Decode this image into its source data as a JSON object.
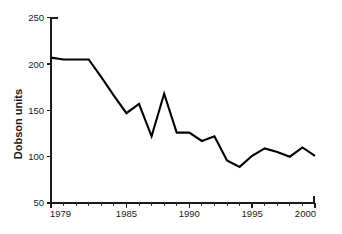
{
  "chart_data": {
    "type": "line",
    "title": "",
    "subtitle": "",
    "xlabel": "",
    "ylabel": "Dobson units",
    "xlim": [
      1979,
      2000
    ],
    "ylim": [
      50,
      250
    ],
    "grid": false,
    "legend": null,
    "x_tick_labels": [
      "1979",
      "1985",
      "1990",
      "1995",
      "2000"
    ],
    "x_tick_values": [
      1979,
      1985,
      1990,
      1995,
      2000
    ],
    "x_minor_tick_values": [
      1980,
      1981,
      1982,
      1983,
      1984,
      1986,
      1987,
      1988,
      1989,
      1991,
      1992,
      1993,
      1994,
      1996,
      1997,
      1998,
      1999
    ],
    "y_tick_labels": [
      "50",
      "100",
      "150",
      "200",
      "250"
    ],
    "y_tick_values": [
      50,
      100,
      150,
      200,
      250
    ],
    "line_color": "#000000",
    "background_color": "#ffffff",
    "axis_color": "#1a1a1a",
    "x": [
      1979,
      1980,
      1981,
      1982,
      1983,
      1984,
      1985,
      1986,
      1987,
      1988,
      1989,
      1990,
      1991,
      1992,
      1993,
      1994,
      1995,
      1996,
      1997,
      1998,
      1999,
      2000
    ],
    "values": [
      207,
      205,
      205,
      205,
      186,
      166,
      147,
      157,
      122,
      168,
      126,
      126,
      117,
      122,
      96,
      89,
      101,
      109,
      105,
      100,
      110,
      101
    ],
    "series": [
      {
        "name": "Dobson units",
        "values": [
          207,
          205,
          205,
          205,
          186,
          166,
          147,
          157,
          122,
          168,
          126,
          126,
          117,
          122,
          96,
          89,
          101,
          109,
          105,
          100,
          110,
          101
        ]
      }
    ]
  },
  "axes": {
    "y_axis_title": "Dobson units"
  }
}
